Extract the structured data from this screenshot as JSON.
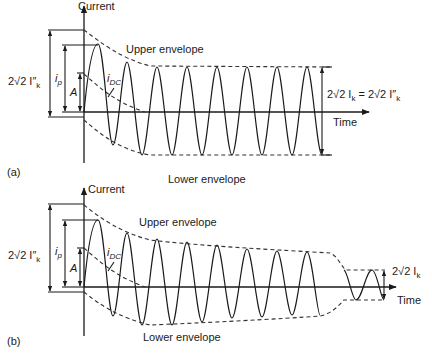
{
  "figure": {
    "panels": [
      {
        "id": "a",
        "panel_label": "(a)",
        "y_axis_label": "Current",
        "x_axis_label": "Time",
        "upper_envelope_label": "Upper envelope",
        "lower_envelope_label": "Lower envelope",
        "dc_component_label": {
          "main": "i",
          "sub": "DC"
        },
        "left_dimensions": [
          {
            "name": "initial-symmetrical-peak",
            "text": "2√2 I″",
            "sub": "k"
          },
          {
            "name": "peak-current",
            "main": "i",
            "sub": "p"
          },
          {
            "name": "dc-initial-value",
            "main": "A"
          }
        ],
        "right_dimension": {
          "text_left": "2√2 I",
          "sub_left": "k",
          "equals": " = ",
          "text_right": "2√2 I″",
          "sub_right": "k"
        },
        "description": "Short-circuit current far from generator: AC component has constant amplitude; DC component decays"
      },
      {
        "id": "b",
        "panel_label": "(b)",
        "y_axis_label": "Current",
        "x_axis_label": "Time",
        "upper_envelope_label": "Upper envelope",
        "lower_envelope_label": "Lower envelope",
        "dc_component_label": {
          "main": "i",
          "sub": "DC"
        },
        "left_dimensions": [
          {
            "name": "initial-symmetrical-peak",
            "text": "2√2 I″",
            "sub": "k"
          },
          {
            "name": "peak-current",
            "main": "i",
            "sub": "p"
          },
          {
            "name": "dc-initial-value",
            "main": "A"
          }
        ],
        "right_dimension": {
          "text_left": "2√2 I",
          "sub_left": "k"
        },
        "description": "Short-circuit current near generator: AC component amplitude decays to steady state; DC component decays"
      }
    ],
    "colors": {
      "line": "#1a1a1a",
      "envelope": "#333333",
      "background": "#ffffff"
    }
  }
}
